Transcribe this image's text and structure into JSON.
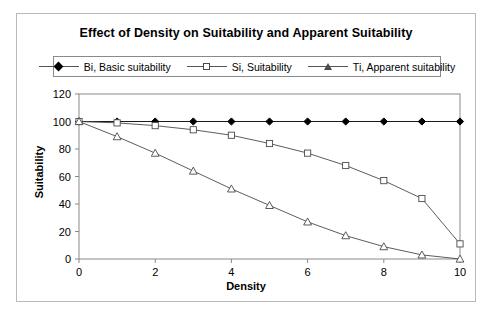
{
  "chart_data": {
    "type": "line",
    "title": "Effect of Density on Suitability and Apparent Suitability",
    "xlabel": "Density",
    "ylabel": "Suitability",
    "x": [
      0,
      1,
      2,
      3,
      4,
      5,
      6,
      7,
      8,
      9,
      10
    ],
    "xlim": [
      0,
      10
    ],
    "ylim": [
      0,
      120
    ],
    "xticks": [
      0,
      2,
      4,
      6,
      8,
      10
    ],
    "yticks": [
      0,
      20,
      40,
      60,
      80,
      100,
      120
    ],
    "xtick_labels": [
      "0",
      "2",
      "4",
      "6",
      "8",
      "10"
    ],
    "ytick_labels": [
      "0",
      "20",
      "40",
      "60",
      "80",
      "100",
      "120"
    ],
    "grid": false,
    "legend_position": "top",
    "series": [
      {
        "name": "Bi, Basic suitability",
        "marker": "filled-diamond",
        "color": "#000000",
        "values": [
          100,
          100,
          100,
          100,
          100,
          100,
          100,
          100,
          100,
          100,
          100
        ]
      },
      {
        "name": "Si, Suitability",
        "marker": "open-square",
        "color": "#4a4a4a",
        "values": [
          100,
          99,
          97,
          94,
          90,
          84,
          77,
          68,
          57,
          44,
          11
        ]
      },
      {
        "name": "Ti, Apparent suitability",
        "marker": "open-triangle",
        "color": "#4a4a4a",
        "values": [
          100,
          89,
          77,
          64,
          51,
          39,
          27,
          17,
          9,
          3,
          0
        ]
      }
    ]
  },
  "legend": {
    "items": [
      {
        "label": "Bi, Basic suitability"
      },
      {
        "label": "Si, Suitability"
      },
      {
        "label": "Ti, Apparent suitability"
      }
    ]
  }
}
